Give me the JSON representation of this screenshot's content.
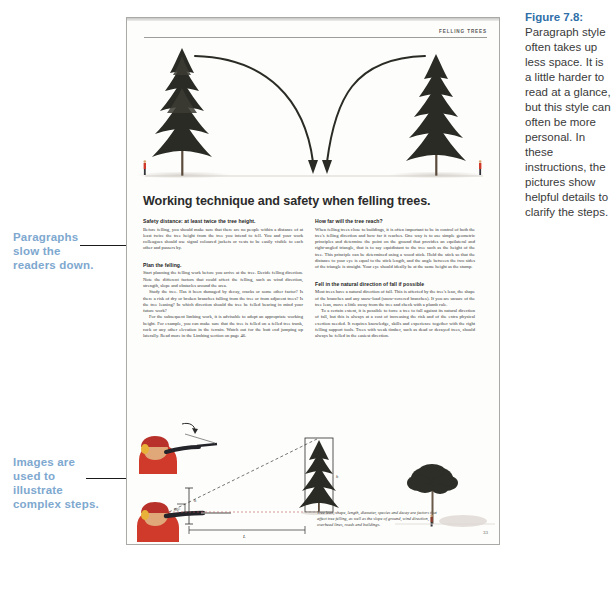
{
  "annotations": [
    {
      "id": "paragraphs-note",
      "text": "Paragraphs\nslow the\nreaders down."
    },
    {
      "id": "images-note",
      "text": "Images are\nused to\nillustrate\ncomplex steps."
    }
  ],
  "figure_caption": {
    "label": "Figure 7.8:",
    "body": " Paragraph style often takes up less space. It is a little harder to read at a glance, but this style can often be more personal. In these instructions, the pictures show helpful details to clarify the steps."
  },
  "book_page": {
    "running_header": "FELLING TREES",
    "headline": "Working technique and safety when felling trees.",
    "page_number": "33",
    "left_column": [
      {
        "heading": "Safety distance: at least twice the tree height.",
        "paragraphs": [
          "Before felling, you should make sure that there are no people within a distance of at least twice the tree height from the tree you intend to fell. You and your work colleagues should use signal coloured jackets or vests to be easily visible to each other and passers by."
        ]
      },
      {
        "heading": "Plan the felling.",
        "paragraphs": [
          "Start planning the felling work before you arrive at the tree. Decide felling direction. Note the different factors that could affect the felling, such as wind direction, strength, slope and obstacles around the area.",
          "Study the tree. Has it been damaged by decay, cracks or some other factor? Is there a risk of dry or broken branches falling from the tree or from adjacent trees? Is the tree leaning? In which direction should the tree be felled bearing in mind your future work?",
          "For the subsequent limbing work, it is advisable to adopt an appropriate working height. For example, you can make sure that the tree is felled on a felled tree trunk, rock or any other elevation in the terrain. Watch out for the butt end jumping up laterally. Read more in the Limbing section on page 46."
        ]
      }
    ],
    "right_column": [
      {
        "heading": "How far will the tree reach?",
        "paragraphs": [
          "When felling trees close to buildings, it is often important to be in control of both the tree's felling direction and how far it reaches. One way is to use simple geometric principles and determine the point on the ground that provides an equilateral and right-angled triangle, that is to say equidistant to the tree such as the height of the tree. This principle can be determined using a wood stick. Hold the stick so that the distance to your eye is equal to the stick length, and the angle between the two sides of the triangle is straight. Your eye should ideally be at the same height as the stump."
        ]
      },
      {
        "heading": "Fell in the natural direction of fall if possible",
        "paragraphs": [
          "Most trees have a natural direction of fall. This is affected by the tree's lean, the shape of the branches and any snow-load (snow-covered branches). If you are unsure of the tree lean, move a little away from the tree and check with a plumb rule.",
          "To a certain extent, it is possible to force a tree to fall against its natural direction of fall, but this is always at a cost of increasing the risk and of the extra physical exertion needed. It requires knowledge, skills and experience together with the right felling support tools. Trees with weak timber, such as dead or decayed trees, should always be felled in the easiest direction."
        ]
      }
    ],
    "bottom_figure_caption": "Tree lean, shape, length, diameter, species and decay are factors that affect tree felling, as well as the slope of ground, wind direction, overhead lines, roads and buildings.",
    "diagram_labels": {
      "angle": "90°",
      "height": "h",
      "distance": "L"
    }
  },
  "colors": {
    "annotation": "#7ea8cf",
    "caption_title": "#2f6fa8",
    "page_bg": "#fdfdfb",
    "page_border": "#a9aaa6",
    "worker_red": "#cf3a2b",
    "tree_dark": "#2b2b26"
  }
}
